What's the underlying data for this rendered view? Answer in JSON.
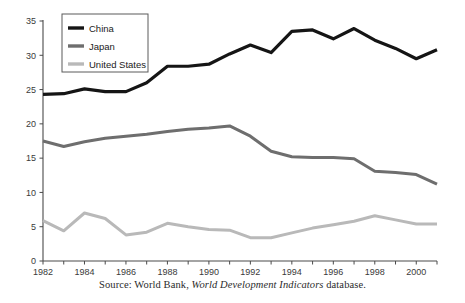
{
  "chart_data": {
    "type": "line",
    "title": "",
    "subtitle": "",
    "xlabel": "",
    "ylabel": "",
    "xlim": [
      1982,
      2001
    ],
    "ylim": [
      0,
      35
    ],
    "yticks": [
      0,
      5,
      10,
      15,
      20,
      25,
      30,
      35
    ],
    "xticks": [
      1982,
      1983,
      1984,
      1985,
      1986,
      1987,
      1988,
      1989,
      1990,
      1991,
      1992,
      1993,
      1994,
      1995,
      1996,
      1997,
      1998,
      1999,
      2000,
      2001
    ],
    "xtick_labels_shown": [
      1982,
      1984,
      1986,
      1988,
      1990,
      1992,
      1994,
      1996,
      1998,
      2000
    ],
    "grid": false,
    "legend_position": "top-left",
    "x": [
      1982,
      1983,
      1984,
      1985,
      1986,
      1987,
      1988,
      1989,
      1990,
      1991,
      1992,
      1993,
      1994,
      1995,
      1996,
      1997,
      1998,
      1999,
      2000,
      2001
    ],
    "series": [
      {
        "name": "China",
        "color": "#151515",
        "width": 3.2,
        "values": [
          24.3,
          24.4,
          25.1,
          24.7,
          24.7,
          26.0,
          28.4,
          28.4,
          28.7,
          30.2,
          31.5,
          30.4,
          33.5,
          33.7,
          32.4,
          33.9,
          32.2,
          31.0,
          29.5,
          30.8
        ]
      },
      {
        "name": "Japan",
        "color": "#6e6e6e",
        "width": 3.0,
        "values": [
          17.5,
          16.7,
          17.4,
          17.9,
          18.2,
          18.5,
          18.9,
          19.2,
          19.4,
          19.7,
          18.2,
          16.0,
          15.2,
          15.1,
          15.1,
          14.9,
          13.1,
          12.9,
          12.6,
          11.2
        ]
      },
      {
        "name": "United States",
        "color": "#b9b9b9",
        "width": 3.0,
        "values": [
          5.9,
          4.4,
          7.0,
          6.2,
          3.8,
          4.2,
          5.5,
          5.0,
          4.6,
          4.5,
          3.4,
          3.4,
          4.1,
          4.8,
          5.3,
          5.8,
          6.6,
          6.0,
          5.4,
          5.4
        ]
      }
    ],
    "legend_entries": [
      {
        "label": "China",
        "color": "#151515"
      },
      {
        "label": "Japan",
        "color": "#6e6e6e"
      },
      {
        "label": "United States",
        "color": "#b9b9b9"
      }
    ]
  },
  "caption": {
    "prefix": "Source: World Bank, ",
    "italic": "World Development Indicators",
    "suffix": " database."
  }
}
